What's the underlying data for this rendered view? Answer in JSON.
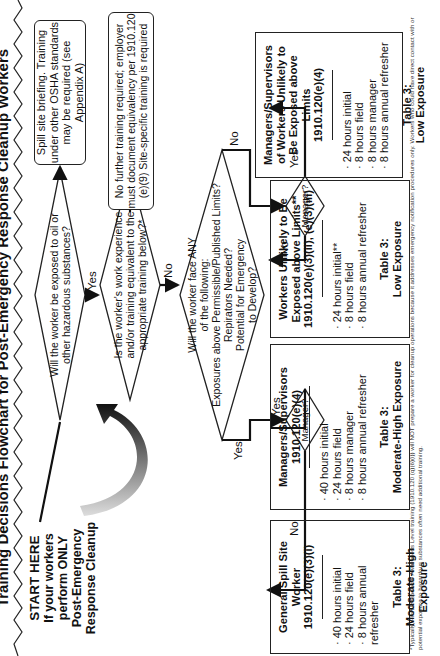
{
  "title": "Training Decisions Flowchart for Post-Emergency Response Cleanup Workers",
  "start": {
    "heading": "START HERE",
    "line1": "If your workers perform ONLY",
    "line2": "Post-Emergency",
    "line3": "Response Cleanup"
  },
  "q1": {
    "text": "Will the worker be exposed to oil or other hazardous substances?",
    "no_label": "No",
    "yes_label": "Yes"
  },
  "spill_briefing": "Spill site briefing. Training under other OSHA standards may be required (see Appendix A)",
  "q2": {
    "text": "Is the worker's work experience and/or training equivalent to the appropriate training below?*",
    "yes_label": "Yes",
    "no_label": "No"
  },
  "no_further": "No further training required; employer must document equivalency per 1910.120 (e)(9) Site-specific training is required",
  "q3": {
    "line1": "Will the worker face ANY",
    "line2": "of the following:",
    "line3": "Exposures above Permissible/Published Limits?",
    "line4": "Repirators Needed?",
    "line5": "Potential for Emergency",
    "line6": "to Develop?",
    "yes_label": "Yes",
    "no_label": "No"
  },
  "manager_left": {
    "text": "Manager?",
    "no_label": "No",
    "yes_label": "Yes"
  },
  "manager_right": {
    "text": "Manager?",
    "no_label": "No",
    "yes_label": "Yes"
  },
  "boxes": [
    {
      "title1": "General Spill Site Worker",
      "title2": "1910.120(e)(3)(i)",
      "items": [
        "40 hours initial",
        "24 hours field",
        "8 hours annual refresher"
      ],
      "table": "Table 3:",
      "exposure": "Moderate-High Exposure"
    },
    {
      "title1": "Managers/Supervisors",
      "title2": "1910.120(e)(4)",
      "items": [
        "40 hours initial",
        "24 hours field",
        "8 hours manager",
        "8 hours annual refresher"
      ],
      "table": "Table 3:",
      "exposure": "Moderate-High Exposure"
    },
    {
      "title1": "Workers Unlikely to Be Exposed above Limits**",
      "title2": "1910.120(e)(3)(ii), (e)(3)(iii)",
      "items": [
        "24 hours initial**",
        "8 hours field",
        "8 hours annual refresher"
      ],
      "table": "Table 3:",
      "exposure": "Low Exposure"
    },
    {
      "title1": "Managers/Supervisors of Workers Unlikely to Be Exposed above Limits",
      "title2": "1910.120(e)(4)",
      "items": [
        "24 hours initial",
        "8 hours field",
        "8 hours manager",
        "8 hours annual refresher"
      ],
      "table": "Table 3:",
      "exposure": "Low Exposure"
    }
  ],
  "footnote": "*Typically, First Responder Awareness Level training (1910.120 (q)(6)(i)) will NOT prepare a worker for cleanup operations because it addresses emergency notification procedures only. Workers who could have direct contact with or potential exposure to hazardous substances often need additional training."
}
